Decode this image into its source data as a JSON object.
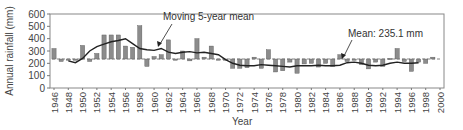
{
  "chart_data": {
    "type": "bar",
    "title": "",
    "xlabel": "Year",
    "ylabel": "Annual rainfall (mm)",
    "ylim": [
      0,
      600
    ],
    "yticks": [
      0,
      100,
      200,
      300,
      400,
      500,
      600
    ],
    "xticks": [
      "1946",
      "1948",
      "1950",
      "1952",
      "1954",
      "1956",
      "1958",
      "1960",
      "1962",
      "1964",
      "1966",
      "1968",
      "1970",
      "1972",
      "1974",
      "1976",
      "1978",
      "1980",
      "1982",
      "1984",
      "1986",
      "1988",
      "1990",
      "1992",
      "1994",
      "1996",
      "1998",
      "2000"
    ],
    "xlim": [
      1946,
      2000
    ],
    "grid": false,
    "baseline": 235.1,
    "annotations": [
      {
        "text": "Moving 5-year mean",
        "points_to": "moving-average-line"
      },
      {
        "text": "Mean: 235.1 mm",
        "points_to": "mean-line"
      }
    ],
    "x": [
      1946,
      1947,
      1948,
      1949,
      1950,
      1951,
      1952,
      1953,
      1954,
      1955,
      1956,
      1957,
      1958,
      1959,
      1960,
      1961,
      1962,
      1963,
      1964,
      1965,
      1966,
      1967,
      1968,
      1969,
      1970,
      1971,
      1972,
      1973,
      1974,
      1975,
      1976,
      1977,
      1978,
      1979,
      1980,
      1981,
      1982,
      1983,
      1984,
      1985,
      1986,
      1987,
      1988,
      1989,
      1990,
      1991,
      1992,
      1993,
      1994,
      1995,
      1996,
      1997,
      1998,
      1999
    ],
    "series": [
      {
        "name": "Annual rainfall",
        "type": "bar",
        "values": [
          320,
          215,
          235,
          225,
          345,
          215,
          280,
          430,
          430,
          430,
          340,
          330,
          505,
          175,
          255,
          270,
          390,
          230,
          300,
          220,
          400,
          250,
          340,
          230,
          225,
          160,
          160,
          165,
          250,
          160,
          310,
          130,
          140,
          210,
          120,
          195,
          200,
          170,
          200,
          175,
          270,
          215,
          225,
          190,
          155,
          210,
          175,
          240,
          320,
          215,
          135,
          210,
          200,
          250
        ]
      },
      {
        "name": "Moving 5-year mean",
        "type": "line",
        "x": [
          1948,
          1949,
          1950,
          1951,
          1952,
          1953,
          1954,
          1955,
          1956,
          1957,
          1958,
          1959,
          1960,
          1961,
          1962,
          1963,
          1964,
          1965,
          1966,
          1967,
          1968,
          1969,
          1970,
          1971,
          1972,
          1973,
          1974,
          1975,
          1976,
          1977,
          1978,
          1979,
          1980,
          1981,
          1982,
          1983,
          1984,
          1985,
          1986,
          1987,
          1988,
          1989,
          1990,
          1991,
          1992,
          1993,
          1994,
          1995,
          1996,
          1997
        ],
        "values": [
          220,
          205,
          240,
          300,
          335,
          355,
          375,
          385,
          400,
          360,
          320,
          310,
          305,
          320,
          290,
          280,
          290,
          295,
          285,
          290,
          280,
          270,
          230,
          200,
          185,
          180,
          180,
          190,
          185,
          180,
          175,
          170,
          180,
          180,
          180,
          185,
          180,
          180,
          185,
          205,
          210,
          200,
          185,
          180,
          185,
          200,
          210,
          200,
          200,
          205
        ]
      },
      {
        "name": "Mean",
        "type": "hline",
        "value": 235.1
      }
    ]
  },
  "labels": {
    "ylabel": "Annual rainfall (mm)",
    "xlabel": "Year",
    "moving_avg": "Moving 5-year mean",
    "mean": "Mean: 235.1 mm"
  }
}
